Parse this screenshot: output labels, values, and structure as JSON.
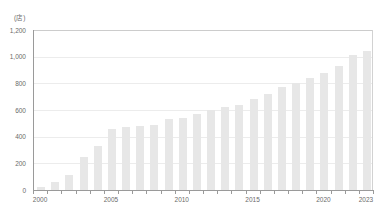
{
  "chart_data": {
    "type": "bar",
    "title": "",
    "unit_label": "(店)",
    "xlabel": "",
    "ylabel": "",
    "ylim": [
      0,
      1200
    ],
    "yticks": [
      "0",
      "200",
      "400",
      "600",
      "800",
      "1,000",
      "1,200"
    ],
    "ytick_values": [
      0,
      200,
      400,
      600,
      800,
      1000,
      1200
    ],
    "grid": true,
    "legend": "none",
    "bar_color": "#e7e7e7",
    "axis_color": "#9a9a9a",
    "grid_color": "#ececec",
    "categories": [
      "2000",
      "2001",
      "2002",
      "2003",
      "2004",
      "2005",
      "2006",
      "2007",
      "2008",
      "2009",
      "2010",
      "2011",
      "2012",
      "2013",
      "2014",
      "2015",
      "2016",
      "2017",
      "2018",
      "2019",
      "2020",
      "2021",
      "2022",
      "2023"
    ],
    "values": [
      20,
      60,
      110,
      250,
      330,
      460,
      470,
      480,
      490,
      530,
      540,
      570,
      600,
      620,
      640,
      680,
      720,
      770,
      800,
      840,
      880,
      930,
      1010,
      1040
    ],
    "xtick_labels": [
      "2000",
      "2005",
      "2010",
      "2015",
      "2020",
      "2023"
    ],
    "xtick_categories": [
      "2000",
      "2005",
      "2010",
      "2015",
      "2020",
      "2023"
    ]
  }
}
